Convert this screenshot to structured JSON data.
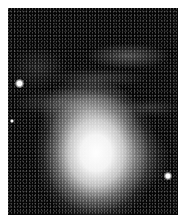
{
  "image": {
    "description": "Grayscale astronomical photograph of a bright nebula with diffuse glowing core and wispy filaments against a dark, speckled star field",
    "border_color": "#ffffff",
    "background_color": "#050505",
    "core_color": "#ffffff",
    "stars": [
      {
        "name": "bright-star-left",
        "x": 11,
        "y": 75,
        "size": 8
      },
      {
        "name": "small-star-left",
        "x": 4,
        "y": 113,
        "size": 4
      },
      {
        "name": "bright-star-right",
        "x": 160,
        "y": 168,
        "size": 7
      }
    ]
  }
}
